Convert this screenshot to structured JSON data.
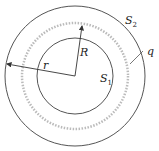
{
  "diagram": {
    "labels": {
      "S2": "S",
      "S2_sub": "2",
      "S1": "S",
      "S1_sub": "1",
      "q": "q",
      "R": "R",
      "r": "r"
    },
    "colors": {
      "line": "#444444",
      "charge": "#b0b0b0"
    }
  }
}
